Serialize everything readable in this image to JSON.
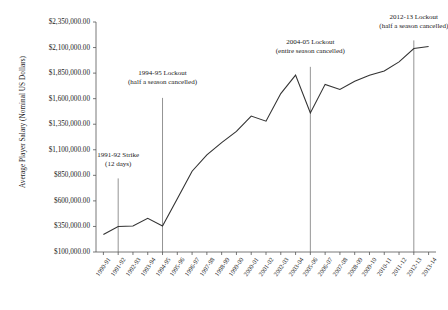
{
  "chart_data": {
    "type": "line",
    "title": "",
    "xlabel": "",
    "ylabel": "Average Player Salary (Nominal US Dollars)",
    "ylim": [
      100000,
      2350000
    ],
    "ytick_values": [
      100000,
      350000,
      600000,
      850000,
      1100000,
      1350000,
      1600000,
      1850000,
      2100000,
      2350000
    ],
    "ytick_labels": [
      "$100,000.00",
      "$350,000.00",
      "$600,000.00",
      "$850,000.00",
      "$1,100,000.00",
      "$1,350,000.00",
      "$1,600,000.00",
      "$1,850,000.00",
      "$2,100,000.00",
      "$2,350,000.00"
    ],
    "categories": [
      "1990-91",
      "1991-92",
      "1992-93",
      "1993-94",
      "1994-95",
      "1995-96",
      "1996-97",
      "1997-98",
      "1998-99",
      "1999-00",
      "2000-01",
      "2001-02",
      "2002-03",
      "2003-04",
      "2005-06",
      "2006-07",
      "2007-08",
      "2008-09",
      "2009-10",
      "2010-11",
      "2011-12",
      "2012-13",
      "2013-14"
    ],
    "values": [
      271000,
      350000,
      355000,
      430000,
      355000,
      620000,
      890000,
      1050000,
      1170000,
      1280000,
      1430000,
      1380000,
      1650000,
      1830000,
      1460000,
      1740000,
      1690000,
      1770000,
      1830000,
      1870000,
      1960000,
      2090000,
      2110000
    ],
    "grid": false,
    "legend": null,
    "line_color": "#333333",
    "annotations": [
      {
        "id": "strike-1991-92",
        "line1": "1991-92 Strike",
        "line2": "(12 days)",
        "category": "1991-92",
        "text_x_pct": 4.5,
        "text_y_pct": 56.0,
        "rule_top_pct": 68.0,
        "rule_bottom_pct": 100.0
      },
      {
        "id": "lockout-1994-95",
        "line1": "1994-95 Lockout",
        "line2": "(half a season cancelled)",
        "category": "1994-95",
        "text_x_pct": 22.0,
        "text_y_pct": 20.5,
        "rule_top_pct": 33.0,
        "rule_bottom_pct": 100.0
      },
      {
        "id": "lockout-2004-05",
        "line1": "2004-05 Lockout",
        "line2": "(entire season cancelled)",
        "category": "2005-06",
        "text_x_pct": 61.0,
        "text_y_pct": 7.0,
        "rule_top_pct": 19.5,
        "rule_bottom_pct": 100.0
      },
      {
        "id": "lockout-2012-13",
        "line1": "2012-13 Lockout",
        "line2": "(half a season cancelled)",
        "category": "2012-13",
        "text_x_pct": 93.5,
        "text_y_pct": -4.0,
        "rule_top_pct": 8.0,
        "rule_bottom_pct": 100.0
      }
    ]
  }
}
